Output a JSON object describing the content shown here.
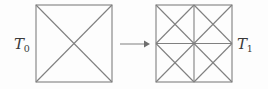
{
  "figure": {
    "type": "mesh-refinement-diagram",
    "background_color": "#fdfdfd",
    "line_color": "#808080",
    "label_color": "#3a3a3a",
    "width": 268,
    "height": 89
  },
  "left_mesh": {
    "label_symbol": "T",
    "label_subscript": "0",
    "label_full": "T0",
    "shape": "square",
    "x": 36,
    "y": 5,
    "size": 76,
    "triangle_count": 4,
    "description": "coarse square with two diagonals"
  },
  "arrow": {
    "name": "refinement-arrow",
    "direction": "right",
    "x_start": 120,
    "x_end": 148,
    "y": 44
  },
  "right_mesh": {
    "label_symbol": "T",
    "label_subscript": "1",
    "label_full": "T1",
    "shape": "square",
    "x": 156,
    "y": 5,
    "size": 76,
    "triangle_count": 16,
    "description": "refined square: four sub-squares each with two diagonals"
  }
}
